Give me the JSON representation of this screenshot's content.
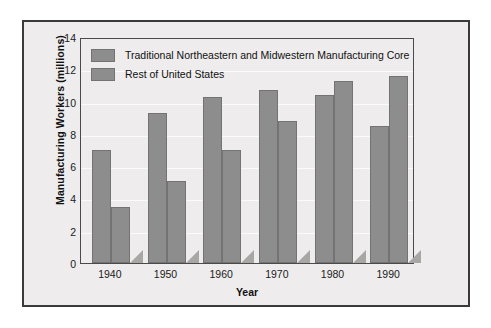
{
  "figure": {
    "background_color": "#eeecec",
    "frame_color": "#3a3a3a",
    "bar_color": "#8d8d8d",
    "bar_edge_color": "#737373",
    "shadow_color": "#a9a6a6"
  },
  "legend": {
    "position": "top-left-inside-plot",
    "entries": [
      {
        "label": "Traditional Northeastern and Midwestern Manufacturing Core",
        "swatch_name": "legend-swatch-core"
      },
      {
        "label": "Rest of United States",
        "swatch_name": "legend-swatch-rest"
      }
    ]
  },
  "axes": {
    "y_title": "Manufacturing Workers (millions)",
    "x_title": "Year",
    "y_ticks": [
      "0",
      "2",
      "4",
      "6",
      "8",
      "10",
      "12",
      "14"
    ],
    "x_ticks": [
      "1940",
      "1950",
      "1960",
      "1970",
      "1980",
      "1990"
    ]
  },
  "chart_data": {
    "type": "bar",
    "title": "",
    "subtitle": "",
    "xlabel": "Year",
    "ylabel": "Manufacturing Workers (millions)",
    "categories": [
      "1940",
      "1950",
      "1960",
      "1970",
      "1980",
      "1990"
    ],
    "series": [
      {
        "name": "Traditional Northeastern and Midwestern Manufacturing Core",
        "values": [
          7.0,
          9.3,
          10.3,
          10.7,
          10.4,
          8.5
        ]
      },
      {
        "name": "Rest of United States",
        "values": [
          3.5,
          5.1,
          7.0,
          8.8,
          11.3,
          11.6
        ]
      }
    ],
    "ylim": [
      0,
      14
    ],
    "ytick_step": 2,
    "grid": true,
    "grid_axis": "y",
    "legend_position": "upper left",
    "bar_grouping": "grouped-adjacent",
    "annotations": []
  }
}
